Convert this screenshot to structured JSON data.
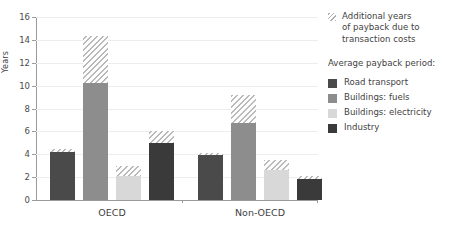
{
  "chart_data": {
    "type": "bar",
    "title": "",
    "subtitle": "",
    "xlabel": "",
    "ylabel": "Years",
    "ylim": [
      0,
      16
    ],
    "ytick_step": 2,
    "yticks": [
      0,
      2,
      4,
      6,
      8,
      10,
      12,
      14,
      16
    ],
    "grid": true,
    "stacked": true,
    "legend_position": "right",
    "categories": [
      "OECD",
      "Non-OECD"
    ],
    "series": [
      {
        "name": "Road transport",
        "color": "#4a4a4a",
        "values": [
          4.2,
          3.9
        ],
        "extra_name": "Additional years of payback due to transaction costs",
        "extra_values": [
          0.3,
          0.2
        ],
        "totals": [
          4.5,
          4.1
        ]
      },
      {
        "name": "Buildings: fuels",
        "color": "#8d8d8d",
        "values": [
          10.2,
          6.7
        ],
        "extra_name": "Additional years of payback due to transaction costs",
        "extra_values": [
          4.1,
          2.5
        ],
        "totals": [
          14.3,
          9.2
        ]
      },
      {
        "name": "Buildings: electricity",
        "color": "#d8d8d8",
        "values": [
          2.1,
          2.6
        ],
        "extra_name": "Additional years of payback due to transaction costs",
        "extra_values": [
          0.9,
          0.9
        ],
        "totals": [
          3.0,
          3.5
        ]
      },
      {
        "name": "Industry",
        "color": "#3a3a3a",
        "values": [
          5.0,
          1.8
        ],
        "extra_name": "Additional years of payback due to transaction costs",
        "extra_values": [
          1.0,
          0.3
        ],
        "totals": [
          6.0,
          2.1
        ]
      }
    ]
  },
  "axis": {
    "ylabel": "Years",
    "ytick_labels": [
      "16",
      "14",
      "12",
      "10",
      "8",
      "6",
      "4",
      "2",
      "0"
    ],
    "xtick_labels": [
      "OECD",
      "Non-OECD"
    ]
  },
  "legend": {
    "note_label": "Additional years of payback due to transaction costs",
    "note_lines": [
      "Additional years",
      "of payback due to",
      "transaction costs"
    ],
    "hatch_swatch_name": "diagonal-hatch-pattern",
    "title": "Average payback period:",
    "items": [
      {
        "label": "Road transport",
        "color": "#4a4a4a"
      },
      {
        "label": "Buildings: fuels",
        "color": "#8d8d8d"
      },
      {
        "label": "Buildings: electricity",
        "color": "#d8d8d8"
      },
      {
        "label": "Industry",
        "color": "#3a3a3a"
      }
    ]
  }
}
